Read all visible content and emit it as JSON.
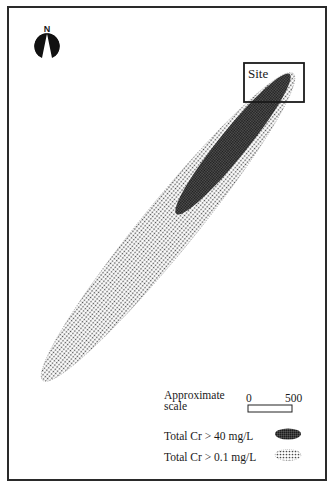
{
  "map": {
    "north_arrow": {
      "label": "N",
      "icon": "north-arrow-icon"
    },
    "site": {
      "label": "Site"
    },
    "plumes": [
      {
        "id": "low",
        "description": "Total Cr > 0.1 mg/L",
        "fill": "stippled-light",
        "color": "#555555"
      },
      {
        "id": "high",
        "description": "Total Cr > 40 mg/L",
        "fill": "stippled-dark",
        "color": "#2b2b2b"
      }
    ]
  },
  "legend": {
    "scale_title": "Approximate scale",
    "scale_start": "0",
    "scale_end": "500",
    "items": [
      {
        "label": "Total Cr > 40 mg/L",
        "symbol": "dark-ellipse"
      },
      {
        "label": "Total Cr > 0.1 mg/L",
        "symbol": "light-dotted-ellipse"
      }
    ]
  }
}
